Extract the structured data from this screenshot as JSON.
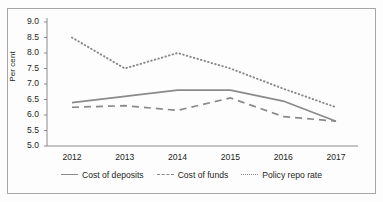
{
  "figure": {
    "background": "#ffffff",
    "border_color": "#a9a7a5",
    "line_color": "#8a8a8a",
    "axis_color": "#8a8a8a",
    "text_color": "#231f20"
  },
  "axes": {
    "ylabel": "Per cent",
    "yticks": [
      "5.0",
      "5.5",
      "6.0",
      "6.5",
      "7.0",
      "7.5",
      "8.0",
      "8.5",
      "9.0"
    ],
    "xticks": [
      "2012",
      "2013",
      "2014",
      "2015",
      "2016",
      "2017"
    ]
  },
  "legend": {
    "items": [
      {
        "label": "Cost of deposits",
        "style": "solid"
      },
      {
        "label": "Cost of funds",
        "style": "dashed"
      },
      {
        "label": "Policy repo rate",
        "style": "dotted"
      }
    ]
  },
  "chart_data": {
    "type": "line",
    "title": "",
    "subtitle": "",
    "xlabel": "",
    "ylabel": "Per cent",
    "categories": [
      "2012",
      "2013",
      "2014",
      "2015",
      "2016",
      "2017"
    ],
    "x": [
      2012,
      2013,
      2014,
      2015,
      2016,
      2017
    ],
    "ylim": [
      5.0,
      9.0
    ],
    "ytick_step": 0.5,
    "grid": false,
    "legend_position": "bottom",
    "series": [
      {
        "name": "Cost of deposits",
        "style": "solid",
        "color": "#8a8a8a",
        "values": [
          6.4,
          6.6,
          6.8,
          6.8,
          6.45,
          5.8
        ]
      },
      {
        "name": "Cost of funds",
        "style": "dashed",
        "color": "#8a8a8a",
        "values": [
          6.25,
          6.3,
          6.15,
          6.55,
          5.95,
          5.8
        ]
      },
      {
        "name": "Policy repo rate",
        "style": "dotted",
        "color": "#8a8a8a",
        "values": [
          8.5,
          7.5,
          8.0,
          7.5,
          6.85,
          6.25
        ]
      }
    ]
  }
}
